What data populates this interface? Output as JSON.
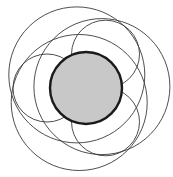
{
  "diagram": {
    "central_circle": {
      "fill": "#c8c8c8",
      "stroke": "#1a1a1a",
      "label": ""
    },
    "outer_circles": [
      {
        "name": "large-circle-1",
        "group": "large"
      },
      {
        "name": "large-circle-2",
        "group": "large"
      },
      {
        "name": "large-circle-3",
        "group": "large"
      },
      {
        "name": "small-circle-1",
        "group": "small"
      },
      {
        "name": "small-circle-2",
        "group": "small"
      },
      {
        "name": "small-circle-3",
        "group": "small"
      }
    ],
    "line_color": "#3a3a3a",
    "background": "#ffffff"
  }
}
